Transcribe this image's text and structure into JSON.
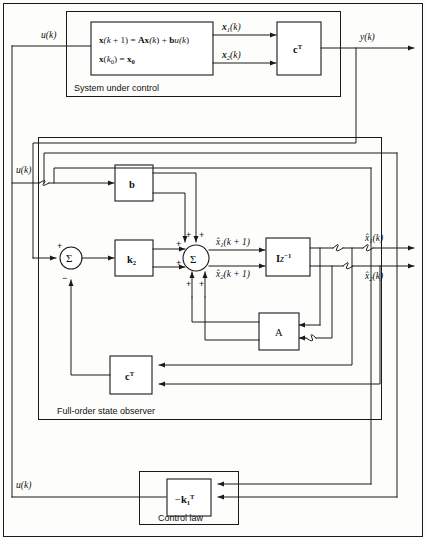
{
  "figure": {
    "background_color": "#fdfdfb",
    "line_color": "#1a1a1a"
  },
  "sections": {
    "plant": {
      "caption": "System under control",
      "equation_line1_parts": {
        "x_bold": "x",
        "arg1": "(k + 1) = ",
        "A_bold": "A",
        "x2_bold": "x",
        "arg2": "(k) + ",
        "b_bold": "b",
        "u_ital": "u",
        "arg3": "(k)"
      },
      "equation_line2_parts": {
        "x_bold": "x",
        "open": "(",
        "k_ital": "k",
        "sub0": "0",
        "close": ") = ",
        "x0_bold": "x",
        "x0_sub": "0"
      }
    },
    "observer": {
      "caption": "Full-order state observer"
    },
    "control_law": {
      "caption": "Control law"
    }
  },
  "blocks": {
    "plant_equation": {
      "name": "plant-state-equation",
      "line1": "x(k + 1) = Ax(k) + bu(k)",
      "line2": "x(k0) = x0"
    },
    "plant_output": {
      "name": "plant-output-matrix",
      "label": "c",
      "superscript": "T"
    },
    "b_gain": {
      "name": "input-vector-b",
      "label": "b"
    },
    "k2_gain": {
      "name": "observer-gain-k2",
      "label": "k",
      "subscript": "2"
    },
    "delay": {
      "name": "unit-delay",
      "label": "I",
      "exponent": "z",
      "power": "−1"
    },
    "a_matrix": {
      "name": "system-matrix-a",
      "label": "A"
    },
    "observer_output": {
      "name": "observer-output-matrix",
      "label": "c",
      "superscript": "T"
    },
    "feedback_gain": {
      "name": "feedback-gain-k1",
      "minus": "−",
      "label": "k",
      "subscript": "1",
      "superscript": "T"
    }
  },
  "summers": {
    "error_summer": {
      "name": "error-summing-junction",
      "glyph": "Σ",
      "sign_top_left": "+",
      "sign_bottom": "−"
    },
    "state_summer": {
      "name": "state-estimate-summing-junction",
      "glyph": "Σ",
      "signs": [
        "+",
        "+",
        "+",
        "+",
        "+",
        "+",
        "+",
        "+"
      ]
    }
  },
  "signals": {
    "u_top": {
      "name": "input-u-plant",
      "text": "u(k)"
    },
    "u_observer": {
      "name": "input-u-observer",
      "text": "u(k)"
    },
    "u_bottom": {
      "name": "input-u-control-law",
      "text": "u(k)"
    },
    "y_out": {
      "name": "output-y",
      "text": "y(k)"
    },
    "x1": {
      "name": "state-x1",
      "base": "x",
      "sub": "1",
      "arg": "(k)"
    },
    "x2": {
      "name": "state-x2",
      "base": "x",
      "sub": "2",
      "arg": "(k)"
    },
    "xhat1_next": {
      "name": "estimate-x1-next",
      "base": "x̂",
      "sub": "1",
      "arg": "(k + 1)"
    },
    "xhat2_next": {
      "name": "estimate-x2-next",
      "base": "x̂",
      "sub": "2",
      "arg": "(k + 1)"
    },
    "xhat1": {
      "name": "estimate-x1",
      "base": "x̂",
      "sub": "1",
      "arg": "(k)"
    },
    "xhat2": {
      "name": "estimate-x2",
      "base": "x̂",
      "sub": "2",
      "arg": "(k)"
    }
  }
}
